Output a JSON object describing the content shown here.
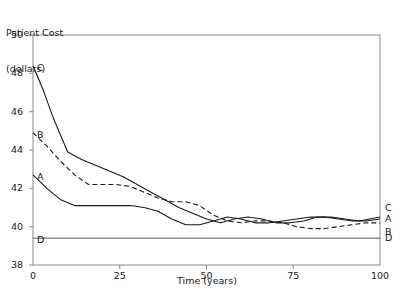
{
  "chart_data": {
    "type": "line",
    "title": "",
    "ylabel": "Patient Cost\n(dollars)",
    "ylabel_line1": "Patient Cost",
    "ylabel_line2": "(dollars)",
    "xlabel": "Time (years)",
    "xlim": [
      0,
      100
    ],
    "ylim": [
      38,
      50
    ],
    "grid": false,
    "legend_position": "right-edge-inline",
    "xticks": [
      0,
      25,
      50,
      75,
      100
    ],
    "xtick_labels": [
      "0",
      "25",
      "50",
      "75",
      "100"
    ],
    "yticks": [
      38,
      40,
      42,
      44,
      46,
      48,
      50
    ],
    "ytick_labels": [
      "38",
      "40",
      "42",
      "44",
      "46",
      "48",
      "50"
    ],
    "series": [
      {
        "name": "C",
        "style": "solid",
        "color": "#1a1a1a",
        "start_label": "C",
        "end_label": "C",
        "x": [
          0,
          3,
          6,
          10,
          14,
          18,
          22,
          26,
          30,
          34,
          38,
          42,
          46,
          50,
          54,
          58,
          62,
          66,
          70,
          74,
          78,
          82,
          86,
          90,
          94,
          97,
          100
        ],
        "y": [
          48.4,
          47.1,
          45.6,
          43.9,
          43.5,
          43.2,
          42.9,
          42.6,
          42.2,
          41.8,
          41.4,
          41.0,
          40.7,
          40.4,
          40.2,
          40.4,
          40.5,
          40.4,
          40.2,
          40.2,
          40.3,
          40.5,
          40.5,
          40.4,
          40.3,
          40.4,
          40.5
        ]
      },
      {
        "name": "B",
        "style": "dashed",
        "color": "#1a1a1a",
        "start_label": "B",
        "end_label": "B",
        "x": [
          0,
          4,
          8,
          12,
          16,
          20,
          24,
          28,
          32,
          36,
          40,
          44,
          48,
          52,
          56,
          60,
          64,
          68,
          72,
          76,
          80,
          84,
          88,
          92,
          96,
          100
        ],
        "y": [
          44.9,
          44.2,
          43.4,
          42.7,
          42.2,
          42.2,
          42.2,
          42.1,
          41.8,
          41.5,
          41.3,
          41.3,
          41.1,
          40.6,
          40.3,
          40.2,
          40.3,
          40.3,
          40.2,
          40.0,
          39.9,
          39.9,
          40.0,
          40.1,
          40.2,
          40.2
        ]
      },
      {
        "name": "A",
        "style": "solid",
        "color": "#1a1a1a",
        "start_label": "A",
        "end_label": "A",
        "x": [
          0,
          4,
          8,
          12,
          16,
          20,
          24,
          28,
          32,
          36,
          40,
          44,
          48,
          52,
          56,
          60,
          64,
          68,
          72,
          76,
          80,
          84,
          88,
          92,
          96,
          100
        ],
        "y": [
          42.7,
          42.0,
          41.4,
          41.1,
          41.1,
          41.1,
          41.1,
          41.1,
          41.0,
          40.8,
          40.4,
          40.1,
          40.1,
          40.3,
          40.5,
          40.4,
          40.2,
          40.2,
          40.3,
          40.4,
          40.5,
          40.5,
          40.4,
          40.3,
          40.3,
          40.4
        ]
      },
      {
        "name": "D",
        "style": "solid",
        "color": "#555555",
        "start_label": "D",
        "end_label": "D",
        "x": [
          0,
          100
        ],
        "y": [
          39.4,
          39.4
        ]
      }
    ]
  }
}
